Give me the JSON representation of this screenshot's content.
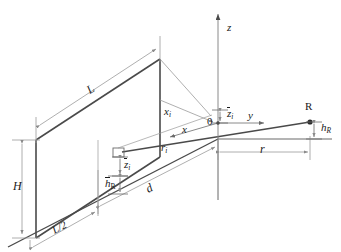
{
  "figure": {
    "background_color": "#ffffff",
    "line_color": "#3a3a3a",
    "solid_line_color": "#4a4a4a",
    "thin_line_color": "#9a9a9a",
    "text_color": "#1a1a1a"
  },
  "axes": {
    "z": {
      "label": "z",
      "italic": true,
      "direction": "up"
    },
    "y": {
      "label": "y",
      "italic": true,
      "direction": "right"
    },
    "x": {
      "label": "x",
      "italic": true,
      "direction": "down-left"
    },
    "origin": {
      "label": "0",
      "italic": false
    }
  },
  "points": {
    "receiver": {
      "label": "R",
      "italic": false
    },
    "source_marker": {
      "label": "",
      "shape": "small-rectangle"
    }
  },
  "dimensions": {
    "length": {
      "label": "L",
      "italic": true
    },
    "half_length": {
      "label": "L/2",
      "italic": true
    },
    "height": {
      "label": "H",
      "italic": true
    },
    "distance_d": {
      "label": "d",
      "italic": true
    },
    "distance_r": {
      "label": "r",
      "italic": true
    },
    "receiver_height": {
      "base": "h",
      "sub": "R",
      "overbar": false
    },
    "receiver_height_bar": {
      "base": "h",
      "sub": "R",
      "overbar": true
    },
    "source_height_bar": {
      "base": "z",
      "sub": "i",
      "overbar": true
    },
    "origin_height_bar": {
      "base": "z",
      "sub": "i",
      "overbar": true
    },
    "x_i": {
      "base": "x",
      "sub": "i",
      "overbar": false
    },
    "r_i": {
      "base": "r",
      "sub": "i",
      "overbar": false
    }
  }
}
